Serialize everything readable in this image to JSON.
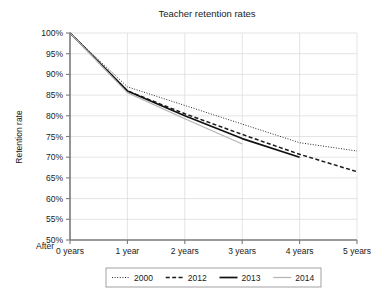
{
  "chart_data": {
    "type": "line",
    "title": "Teacher retention rates",
    "xlabel": "",
    "ylabel": "Retention rate",
    "x_prefix_label": "After",
    "x": [
      0,
      1,
      2,
      3,
      4,
      5
    ],
    "categories": [
      "0 years",
      "1 year",
      "2 years",
      "3 years",
      "4 years",
      "5 years"
    ],
    "ylim": [
      50,
      100
    ],
    "xlim": [
      0,
      5
    ],
    "y_ticks": [
      50,
      55,
      60,
      65,
      70,
      75,
      80,
      85,
      90,
      95,
      100
    ],
    "y_tick_labels": [
      "50%",
      "55%",
      "60%",
      "65%",
      "70%",
      "75%",
      "80%",
      "85%",
      "90%",
      "95%",
      "100%"
    ],
    "grid": true,
    "legend_position": "bottom",
    "series": [
      {
        "name": "2000",
        "style": "dotted",
        "color": "#2b2b2b",
        "width": 1.0,
        "dash": "1,1.6",
        "x": [
          0,
          1,
          2,
          3,
          4,
          5
        ],
        "values": [
          100,
          87.0,
          82.5,
          78.0,
          73.5,
          71.5
        ]
      },
      {
        "name": "2012",
        "style": "dashed",
        "color": "#1a1a1a",
        "width": 1.5,
        "dash": "4,2.4",
        "x": [
          0,
          1,
          2,
          3,
          4,
          5
        ],
        "values": [
          100,
          86.0,
          80.5,
          75.5,
          70.7,
          66.5
        ]
      },
      {
        "name": "2013",
        "style": "solid",
        "color": "#111111",
        "width": 1.7,
        "dash": "",
        "x": [
          0,
          1,
          2,
          3,
          4
        ],
        "values": [
          100,
          86.0,
          80.0,
          74.5,
          70.0
        ]
      },
      {
        "name": "2014",
        "style": "solid",
        "color": "#b4b4b4",
        "width": 1.2,
        "dash": "",
        "x": [
          0,
          1,
          2,
          3
        ],
        "values": [
          100,
          85.6,
          79.3,
          73.2
        ]
      }
    ]
  },
  "legend": {
    "entries": [
      "2000",
      "2012",
      "2013",
      "2014"
    ]
  }
}
